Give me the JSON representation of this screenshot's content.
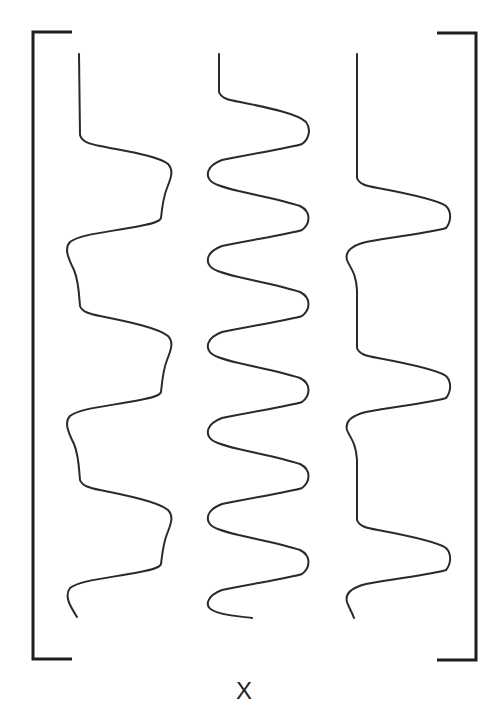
{
  "diagram": {
    "type": "matrix-of-waveforms",
    "label": "X",
    "colors": {
      "background": "#ffffff",
      "stroke": "#2a2a2a",
      "bracket": "#1e1e1e"
    },
    "brackets": {
      "left": {
        "x": 33,
        "y_top": 32,
        "y_bottom": 659,
        "serif_to_x": 72
      },
      "right": {
        "x": 476,
        "y_top": 33,
        "y_bottom": 660,
        "serif_to_x": 437
      }
    },
    "waveforms": [
      {
        "name": "column-1",
        "path": "M79,54 L80,135 C82,142 90,144 100,146 C130,152 158,156 168,164 C174,170 171,178 167,188 C163,198 162,208 161,218 C160,222 150,224 140,226 C110,232 80,234 70,242 C64,248 68,258 74,270 C79,282 79,296 80,306 C82,312 90,314 100,316 C130,322 158,328 168,336 C174,342 171,350 167,360 C163,370 162,382 161,392 C160,396 150,398 140,400 C110,406 80,408 70,416 C64,422 68,432 74,444 C79,456 79,470 80,480 C82,486 90,488 100,490 C130,496 158,502 168,510 C174,516 171,524 167,534 C163,544 162,556 161,564 C160,568 150,570 140,572 C110,578 80,580 70,588 C64,596 70,606 77,617"
      },
      {
        "name": "column-2",
        "path": "M219,54 L219,92 C221,98 228,100 240,102 C270,108 298,114 306,122 C312,130 308,140 302,144 C290,148 250,154 222,160 C206,166 205,176 212,182 C222,190 270,196 300,206 C312,212 310,224 302,230 C290,234 250,240 222,246 C206,252 205,262 212,268 C222,276 270,282 300,292 C312,298 310,310 302,316 C290,320 250,326 222,332 C206,338 205,348 212,354 C222,362 270,368 300,378 C312,384 310,396 302,402 C290,406 250,412 222,418 C206,424 205,434 212,440 C222,448 270,454 300,464 C312,470 310,482 302,488 C290,492 250,498 222,504 C206,510 205,520 212,526 C222,534 270,540 300,550 C312,556 310,568 302,574 C290,578 250,584 222,590 C206,596 205,606 212,610 C222,616 240,616 252,618"
      },
      {
        "name": "column-3",
        "path": "M357,54 L357,178 C359,184 366,186 378,188 C410,194 438,200 446,206 C452,212 451,222 446,228 C434,232 400,236 366,242 C350,246 345,252 347,260 C350,268 356,272 357,290 L357,348 C359,354 366,356 378,358 C410,364 438,370 446,376 C452,382 451,392 446,398 C434,402 400,406 366,412 C350,416 345,422 347,430 C350,438 356,442 357,460 L357,520 C359,526 366,528 378,530 C410,536 438,542 446,548 C452,554 451,564 446,570 C434,574 400,578 366,584 C350,588 345,594 347,602 C349,608 352,612 354,618"
      }
    ]
  }
}
